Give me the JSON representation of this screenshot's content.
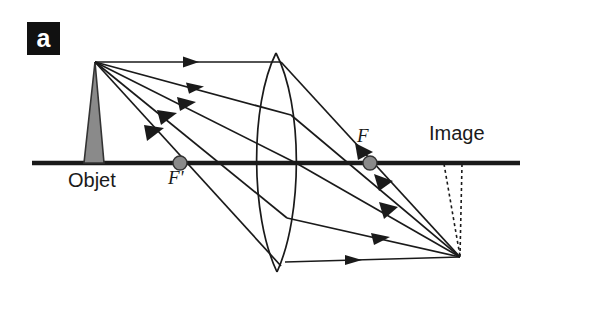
{
  "figure": {
    "panel_label": "a",
    "type": "optical-ray-diagram",
    "background_color": "#ffffff",
    "ink_color": "#1a1a1a",
    "object_fill_color": "#8a8a8a",
    "focal_point_color": "#8a8a8a"
  },
  "labels": {
    "objet": "Objet",
    "image": "Image",
    "focal_near": "F'",
    "focal_far": "F"
  },
  "optics": {
    "axis": {
      "y": 163,
      "x_start": 32,
      "x_end": 520
    },
    "object": {
      "apex_x": 95,
      "apex_y": 62,
      "base_left_x": 84,
      "base_right_x": 104,
      "base_y": 163
    },
    "lens": {
      "center_x": 276,
      "top_y": 53,
      "bottom_y": 272,
      "left_bulge_x": 257,
      "right_bulge_x": 296
    },
    "focal_near": {
      "x": 180,
      "y": 163,
      "radius": 7
    },
    "focal_far": {
      "x": 370,
      "y": 163,
      "radius": 7
    },
    "image_point": {
      "x": 460,
      "y": 257
    },
    "image_dashed_top_left_x": 444,
    "image_dashed_top_right_x": 462,
    "incident_ray_count": 5,
    "refracted_ray_count": 5
  }
}
